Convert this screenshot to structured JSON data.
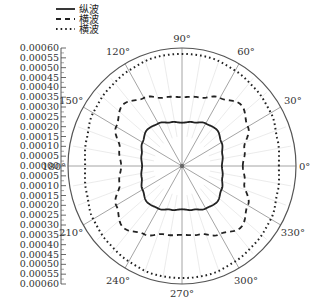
{
  "chart_data": {
    "type": "line",
    "subtype": "polar",
    "title": "",
    "legend": {
      "position": "upper-left",
      "entries": [
        {
          "label": "纵波",
          "style": "solid"
        },
        {
          "label": "横波",
          "style": "dashed"
        },
        {
          "label": "横波",
          "style": "dotted"
        }
      ]
    },
    "angle_ticks": [
      "0°",
      "30°",
      "60°",
      "90°",
      "120°",
      "150°",
      "180°",
      "210°",
      "240°",
      "270°",
      "300°",
      "330°"
    ],
    "radial_axis": {
      "range": [
        0,
        0.0006
      ],
      "tick_labels_upper": [
        "0.00060",
        "0.00055",
        "0.00050",
        "0.00045",
        "0.00040",
        "0.00035",
        "0.00030",
        "0.00025",
        "0.00020",
        "0.00015",
        "0.00010",
        "0.00005",
        "0.00000"
      ],
      "tick_labels_lower": [
        "0.00005",
        "0.00010",
        "0.00015",
        "0.00020",
        "0.00025",
        "0.00030",
        "0.00035",
        "0.00040",
        "0.00045",
        "0.00050",
        "0.00055",
        "0.00060"
      ]
    },
    "theta_deg": [
      0,
      15,
      30,
      45,
      60,
      75,
      90,
      105,
      120,
      135,
      150,
      165,
      180,
      195,
      210,
      225,
      240,
      255,
      270,
      285,
      300,
      315,
      330,
      345,
      360
    ],
    "series": [
      {
        "name": "纵波",
        "style": "solid",
        "values": [
          0.00021,
          0.00022,
          0.00024,
          0.00026,
          0.00025,
          0.00023,
          0.00022,
          0.00023,
          0.00025,
          0.00026,
          0.00024,
          0.00022,
          0.00021,
          0.00022,
          0.00024,
          0.00026,
          0.00025,
          0.00023,
          0.00022,
          0.00023,
          0.00025,
          0.00026,
          0.00024,
          0.00022,
          0.00021
        ]
      },
      {
        "name": "横波",
        "style": "dashed",
        "values": [
          0.00032,
          0.00034,
          0.0004,
          0.00044,
          0.0004,
          0.00036,
          0.00035,
          0.00036,
          0.0004,
          0.00044,
          0.0004,
          0.00034,
          0.00032,
          0.00034,
          0.0004,
          0.00044,
          0.0004,
          0.00036,
          0.00035,
          0.00036,
          0.0004,
          0.00044,
          0.0004,
          0.00034,
          0.00032
        ]
      },
      {
        "name": "横波",
        "style": "dotted",
        "values": [
          0.00051,
          0.00052,
          0.00054,
          0.00055,
          0.00056,
          0.00057,
          0.00057,
          0.00057,
          0.00056,
          0.00055,
          0.00054,
          0.00052,
          0.00051,
          0.00052,
          0.00054,
          0.00055,
          0.00056,
          0.00057,
          0.00057,
          0.00057,
          0.00056,
          0.00055,
          0.00054,
          0.00052,
          0.00051
        ]
      }
    ],
    "grid": true
  }
}
